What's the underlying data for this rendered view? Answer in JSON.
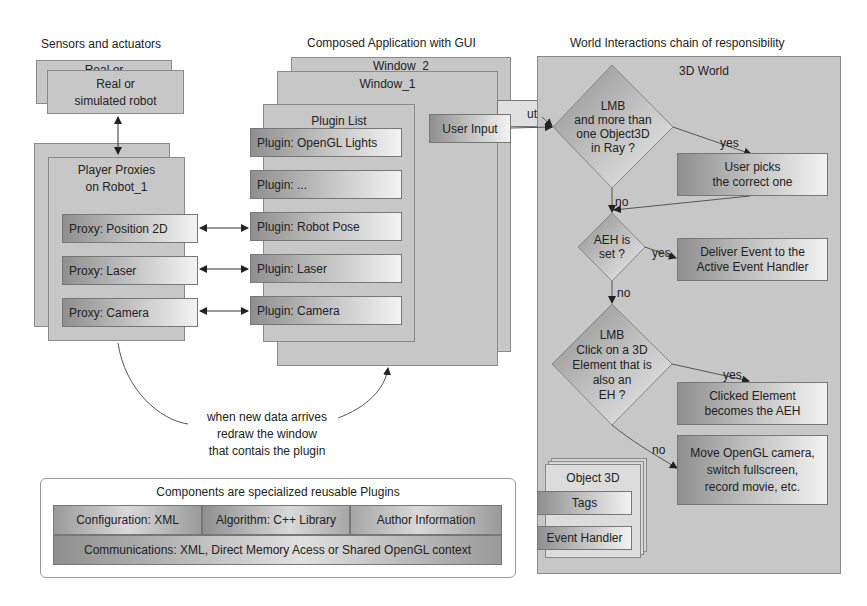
{
  "headings": {
    "sensors": "Sensors and actuators",
    "composed": "Composed Application with GUI",
    "world": "World Interactions chain of responsibility"
  },
  "sensors": {
    "robot_back": "Real or",
    "robot_front_line1": "Real or",
    "robot_front_line2": "simulated robot",
    "proxies_back": "Player Proxies",
    "proxies_front_line1": "Player Proxies",
    "proxies_front_line2": "on Robot_1",
    "proxies": [
      {
        "label": "Proxy: Position 2D"
      },
      {
        "label": "Proxy: Laser"
      },
      {
        "label": "Proxy: Camera"
      }
    ]
  },
  "composed": {
    "window2": "Window_2",
    "window1": "Window_1",
    "plugin_list_title": "Plugin List",
    "plugins": [
      {
        "label": "Plugin: OpenGL Lights"
      },
      {
        "label": "Plugin: ..."
      },
      {
        "label": "Plugin: Robot Pose"
      },
      {
        "label": "Plugin: Laser"
      },
      {
        "label": "Plugin: Camera"
      }
    ],
    "user_input_back": "ut",
    "user_input": "User Input",
    "redraw_note_line1": "when new data arrives",
    "redraw_note_line2": "redraw the window",
    "redraw_note_line3": "that contais the plugin"
  },
  "world": {
    "title": "3D World",
    "decision1": [
      "LMB",
      "and more than",
      "one Object3D",
      "in  Ray ?"
    ],
    "action1": [
      "User picks",
      "the correct one"
    ],
    "decision2": [
      "AEH is",
      "set ?"
    ],
    "action2": [
      "Deliver Event to the",
      "Active Event Handler"
    ],
    "decision3": [
      "LMB",
      "Click on a 3D",
      "Element that is",
      "also an",
      "EH ?"
    ],
    "action3": [
      "Clicked Element",
      "becomes the AEH"
    ],
    "action4": [
      "Move OpenGL camera,",
      "switch fullscreen,",
      "record movie, etc."
    ],
    "yes_label": "yes",
    "no_label": "no",
    "object3d_title": "Object 3D",
    "object3d_tags": "Tags",
    "object3d_handler": "Event Handler"
  },
  "legend": {
    "title": "Components are specialized reusable Plugins",
    "row1": [
      "Configuration: XML",
      "Algorithm: C++ Library",
      "Author Information"
    ],
    "row2": "Communications: XML, Direct Memory Acess or Shared OpenGL context"
  }
}
